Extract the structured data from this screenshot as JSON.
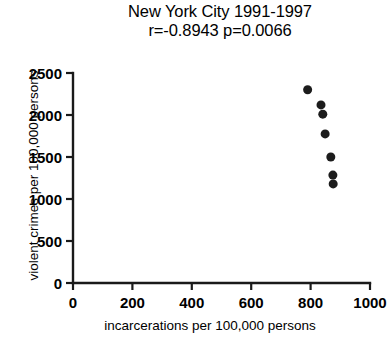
{
  "chart_data": {
    "type": "scatter",
    "title": "New York City 1991-1997",
    "subtitle": "r=-0.8943  p=0.0066",
    "correlation_r": -0.8943,
    "p_value": 0.0066,
    "xlabel": "incarcerations per 100,000 persons",
    "ylabel": "violent crimes per 100,000 persons",
    "xlim": [
      0,
      1000
    ],
    "ylim": [
      0,
      2500
    ],
    "xticks": [
      0,
      200,
      400,
      600,
      800,
      1000
    ],
    "yticks": [
      0,
      500,
      1000,
      1500,
      2000,
      2500
    ],
    "xtick_labels": [
      "0",
      "200",
      "400",
      "600",
      "800",
      "1000"
    ],
    "ytick_labels": [
      "0",
      "500",
      "1000",
      "1500",
      "2000",
      "2500"
    ],
    "grid": false,
    "legend": false,
    "marker": "filled-circle",
    "marker_color": "#1c1c1c",
    "marker_size": 9,
    "series": [
      {
        "name": "New York City",
        "points": [
          {
            "x": 790,
            "y": 2300
          },
          {
            "x": 835,
            "y": 2120
          },
          {
            "x": 841,
            "y": 2010
          },
          {
            "x": 849,
            "y": 1775
          },
          {
            "x": 868,
            "y": 1500
          },
          {
            "x": 875,
            "y": 1285
          },
          {
            "x": 876,
            "y": 1180
          }
        ]
      }
    ]
  },
  "colors": {
    "background": "#ffffff",
    "axis": "#1a1a1a",
    "marker": "#1c1c1c",
    "text": "#000000"
  }
}
